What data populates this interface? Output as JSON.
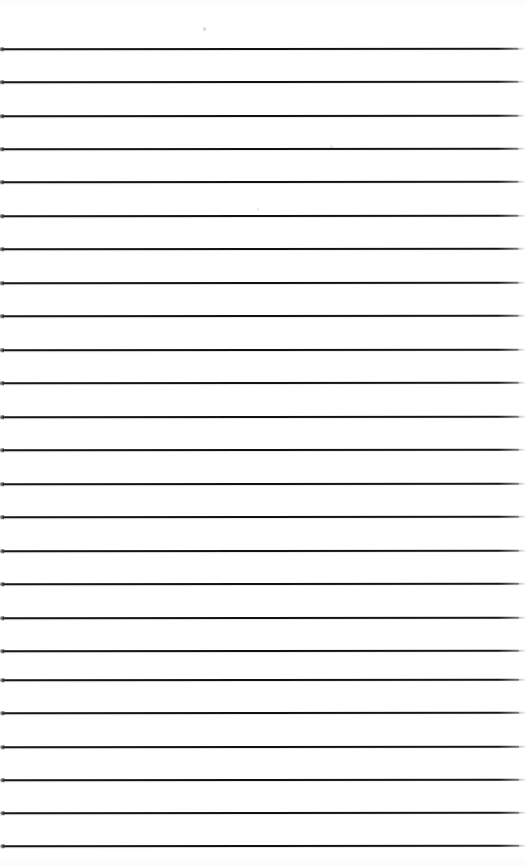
{
  "document": {
    "kind": "scanned-lined-paper",
    "title": "Blank ruled notepaper scan",
    "page_width_px": 526,
    "page_height_px": 866,
    "background_color": "#fefefe",
    "ink_color": "#17171a",
    "has_text": false,
    "text_content": "",
    "orientation": "portrait",
    "skew_degrees": -0.06
  },
  "ruling": {
    "style": "wide-ruled horizontal lines",
    "line_count": 25,
    "first_line_y": 48,
    "line_spacing_px": 33.2,
    "line_thickness_px": 2,
    "line_start_x": 0,
    "line_end_x": 519,
    "left_margin_rule": false,
    "top_margin_px": 45,
    "lines_y": [
      48,
      81,
      115,
      148,
      181,
      215,
      248,
      282,
      315,
      349,
      382,
      416,
      449,
      483,
      516,
      550,
      583,
      617,
      650,
      679,
      712,
      746,
      779,
      812,
      845
    ]
  },
  "artifacts": {
    "right_edge_fade": true,
    "left_edge_nub": true,
    "dust_specks": 3,
    "vignette": true
  }
}
